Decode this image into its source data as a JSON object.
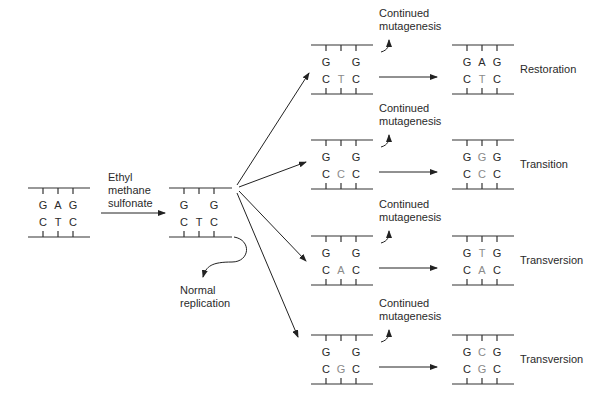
{
  "colors": {
    "ink": "#2a2a2a",
    "mutated_base": "#8a8a8a",
    "line": "#333333"
  },
  "labels": {
    "reagent_line1": "Ethyl",
    "reagent_line2": "methane",
    "reagent_line3": "sulfonate",
    "normal_line1": "Normal",
    "normal_line2": "replication",
    "continued_line1": "Continued",
    "continued_line2": "mutagenesis"
  },
  "original": {
    "top": [
      "G",
      "A",
      "G"
    ],
    "bottom": [
      "C",
      "T",
      "C"
    ]
  },
  "alkylated": {
    "top": [
      "G",
      "",
      "G"
    ],
    "bottom": [
      "C",
      "T",
      "C"
    ]
  },
  "pathways": [
    {
      "intermediate": {
        "top": [
          "G",
          "",
          "G"
        ],
        "bottom": [
          "C",
          "T",
          "C"
        ],
        "mutated_index": 1
      },
      "result": {
        "top": [
          "G",
          "A",
          "G"
        ],
        "bottom": [
          "C",
          "T",
          "C"
        ],
        "gray_top": false,
        "gray_bottom": true
      },
      "outcome": "Restoration"
    },
    {
      "intermediate": {
        "top": [
          "G",
          "",
          "G"
        ],
        "bottom": [
          "C",
          "C",
          "C"
        ],
        "mutated_index": 1
      },
      "result": {
        "top": [
          "G",
          "G",
          "G"
        ],
        "bottom": [
          "C",
          "C",
          "C"
        ],
        "gray_top": true,
        "gray_bottom": true
      },
      "outcome": "Transition"
    },
    {
      "intermediate": {
        "top": [
          "G",
          "",
          "G"
        ],
        "bottom": [
          "C",
          "A",
          "C"
        ],
        "mutated_index": 1
      },
      "result": {
        "top": [
          "G",
          "T",
          "G"
        ],
        "bottom": [
          "C",
          "A",
          "C"
        ],
        "gray_top": true,
        "gray_bottom": true
      },
      "outcome": "Transversion"
    },
    {
      "intermediate": {
        "top": [
          "G",
          "",
          "G"
        ],
        "bottom": [
          "C",
          "G",
          "C"
        ],
        "mutated_index": 1
      },
      "result": {
        "top": [
          "G",
          "C",
          "G"
        ],
        "bottom": [
          "C",
          "G",
          "C"
        ],
        "gray_top": true,
        "gray_bottom": true
      },
      "outcome": "Transversion"
    }
  ]
}
